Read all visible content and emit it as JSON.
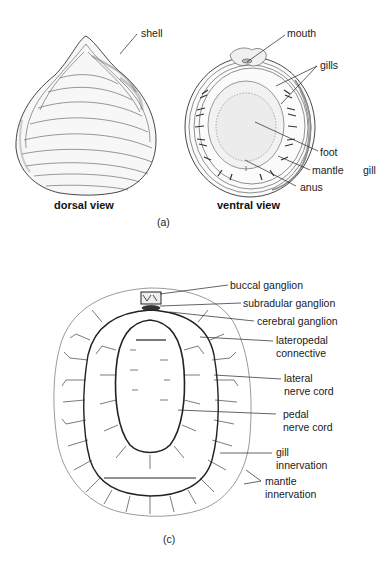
{
  "figure": {
    "panel_a": {
      "label": "(a)",
      "dorsal": {
        "caption": "dorsal view",
        "labels": {
          "shell": "shell"
        }
      },
      "ventral": {
        "caption": "ventral view",
        "labels": {
          "mouth": "mouth",
          "gills": "gills",
          "foot": "foot",
          "mantle": "mantle",
          "anus": "anus",
          "gill": "gill"
        }
      }
    },
    "panel_c": {
      "label": "(c)",
      "labels": {
        "buccal_ganglion": "buccal ganglion",
        "subradular_ganglion": "subradular ganglion",
        "cerebral_ganglion": "cerebral ganglion",
        "lateropedal_connective": "lateropedal\nconnective",
        "lateral_nerve_cord": "lateral\nnerve cord",
        "pedal_nerve_cord": "pedal\nnerve cord",
        "gill_innervation": "gill\ninnervation",
        "mantle_innervation": "mantle\ninnervation"
      }
    },
    "colors": {
      "ink": "#1a1a1a",
      "background": "#ffffff",
      "shade": "#9a9a9a"
    }
  }
}
